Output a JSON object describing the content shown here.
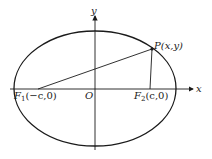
{
  "diagram": {
    "type": "ellipse-with-foci",
    "axes": {
      "x_label": "x",
      "y_label": "y",
      "origin_label": "O"
    },
    "point_p": {
      "label": "P(x,y)"
    },
    "focus_1": {
      "name": "F",
      "subscript": "1",
      "coords": "(−c,0)"
    },
    "focus_2": {
      "name": "F",
      "subscript": "2",
      "coords": "(c,0)"
    },
    "colors": {
      "stroke": "#1a1a1a",
      "background": "#ffffff"
    }
  }
}
